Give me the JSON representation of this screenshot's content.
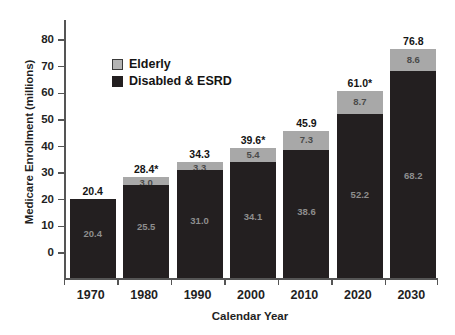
{
  "chart_data": {
    "type": "bar",
    "stacked": true,
    "title": "",
    "xlabel": "Calendar Year",
    "ylabel": "Medicare Enrollment (millions)",
    "categories": [
      "1970",
      "1980",
      "1990",
      "2000",
      "2010",
      "2020",
      "2030"
    ],
    "ylim": [
      0,
      80
    ],
    "yticks": [
      "0",
      "10",
      "20",
      "30",
      "40",
      "50",
      "60",
      "70",
      "80"
    ],
    "ytick_values": [
      0,
      10,
      20,
      30,
      40,
      50,
      60,
      70,
      80
    ],
    "grid": false,
    "legend_position": "upper-left-inside",
    "series": [
      {
        "name": "Disabled & ESRD",
        "color": "#231f20",
        "values": [
          20.4,
          25.5,
          31.0,
          34.1,
          38.6,
          52.2,
          68.2
        ],
        "labels": [
          "20.4",
          "25.5",
          "31.0",
          "34.1",
          "38.6",
          "52.2",
          "68.2"
        ]
      },
      {
        "name": "Elderly",
        "color": "#a8a8a8",
        "values": [
          0.0,
          3.0,
          3.3,
          5.4,
          7.3,
          8.7,
          8.6
        ],
        "labels": [
          "",
          "3.0",
          "3.3",
          "5.4",
          "7.3",
          "8.7",
          "8.6"
        ]
      }
    ],
    "totals": [
      20.4,
      28.4,
      34.3,
      39.6,
      45.9,
      61.0,
      76.8
    ],
    "total_labels": [
      "20.4",
      "28.4*",
      "34.3",
      "39.6*",
      "45.9",
      "61.0*",
      "76.8"
    ]
  },
  "legend": {
    "items": [
      {
        "label": "Elderly",
        "swatch": "light-gray-swatch"
      },
      {
        "label": "Disabled & ESRD",
        "swatch": "dark-swatch"
      }
    ]
  },
  "colors": {
    "elderly": "#a8a8a8",
    "disabled_esrd": "#231f20",
    "axis": "#555555",
    "text": "#1a1a1a"
  }
}
